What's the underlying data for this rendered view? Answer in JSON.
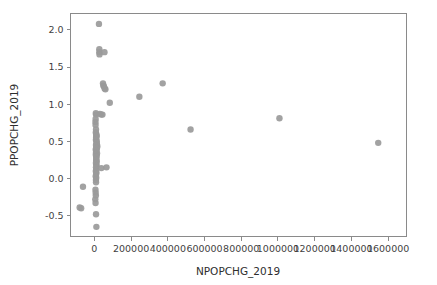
{
  "chart_data": {
    "type": "scatter",
    "title": "",
    "xlabel": "NPOPCHG_2019",
    "ylabel": "PPOPCHG_2019",
    "xlim": [
      -130000,
      1700000
    ],
    "ylim": [
      -0.78,
      2.22
    ],
    "grid": false,
    "legend": null,
    "marker_color": "#9a9a9a",
    "marker_size": 4.2,
    "xticks": [
      0,
      200000,
      400000,
      600000,
      800000,
      1000000,
      1200000,
      1400000,
      1600000
    ],
    "xticklabels": [
      "0",
      "200000",
      "400000",
      "600000",
      "800000",
      "1000000",
      "1200000",
      "1400000",
      "1600000"
    ],
    "yticks": [
      -0.5,
      0.0,
      0.5,
      1.0,
      1.5,
      2.0
    ],
    "yticklabels": [
      "-0.5",
      "0.0",
      "0.5",
      "1.0",
      "1.5",
      "2.0"
    ],
    "points": [
      [
        25000,
        2.08
      ],
      [
        27000,
        1.74
      ],
      [
        27000,
        1.7
      ],
      [
        28000,
        1.67
      ],
      [
        55000,
        1.7
      ],
      [
        47000,
        1.28
      ],
      [
        49000,
        1.25
      ],
      [
        52000,
        1.24
      ],
      [
        56000,
        1.21
      ],
      [
        60000,
        1.2
      ],
      [
        372000,
        1.28
      ],
      [
        245000,
        1.1
      ],
      [
        84000,
        1.02
      ],
      [
        8000,
        0.88
      ],
      [
        9000,
        0.86
      ],
      [
        30000,
        0.87
      ],
      [
        38000,
        0.86
      ],
      [
        44000,
        0.86
      ],
      [
        7000,
        0.8
      ],
      [
        6000,
        0.76
      ],
      [
        6500,
        0.72
      ],
      [
        9000,
        0.66
      ],
      [
        8000,
        0.62
      ],
      [
        10000,
        0.6
      ],
      [
        12000,
        0.58
      ],
      [
        11000,
        0.57
      ],
      [
        9500,
        0.55
      ],
      [
        10500,
        0.53
      ],
      [
        8500,
        0.52
      ],
      [
        13000,
        0.5
      ],
      [
        11500,
        0.48
      ],
      [
        14000,
        0.46
      ],
      [
        9000,
        0.45
      ],
      [
        12000,
        0.44
      ],
      [
        16000,
        0.43
      ],
      [
        10000,
        0.41
      ],
      [
        13500,
        0.4
      ],
      [
        7500,
        0.39
      ],
      [
        11000,
        0.37
      ],
      [
        9000,
        0.35
      ],
      [
        14500,
        0.34
      ],
      [
        8000,
        0.32
      ],
      [
        12500,
        0.31
      ],
      [
        10000,
        0.29
      ],
      [
        11000,
        0.27
      ],
      [
        9500,
        0.25
      ],
      [
        13000,
        0.23
      ],
      [
        8500,
        0.21
      ],
      [
        10500,
        0.19
      ],
      [
        12000,
        0.17
      ],
      [
        9000,
        0.15
      ],
      [
        38000,
        0.14
      ],
      [
        66000,
        0.15
      ],
      [
        10000,
        0.12
      ],
      [
        8000,
        0.1
      ],
      [
        11000,
        0.08
      ],
      [
        9500,
        0.06
      ],
      [
        7500,
        0.03
      ],
      [
        10000,
        0.01
      ],
      [
        8500,
        -0.02
      ],
      [
        9000,
        -0.05
      ],
      [
        524000,
        0.66
      ],
      [
        1008000,
        0.81
      ],
      [
        1546000,
        0.48
      ],
      [
        -62000,
        -0.11
      ],
      [
        6000,
        -0.15
      ],
      [
        7000,
        -0.19
      ],
      [
        8000,
        -0.23
      ],
      [
        -80000,
        -0.39
      ],
      [
        -72000,
        -0.4
      ],
      [
        5000,
        -0.28
      ],
      [
        6500,
        -0.33
      ],
      [
        9000,
        -0.48
      ],
      [
        11000,
        -0.65
      ]
    ]
  }
}
